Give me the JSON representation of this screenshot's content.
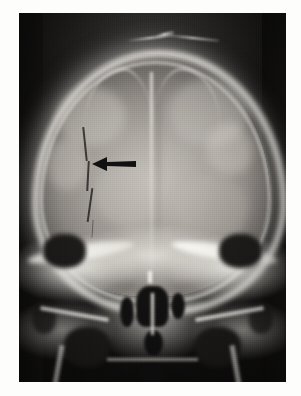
{
  "document": {
    "type": "radiograph",
    "modality": "plain-film-x-ray",
    "view": "frontal-ap-caldwell-skull",
    "background_color": "#fdfdfb",
    "film_color_dark": "#141312",
    "bone_color_light": "#f4f2ec",
    "annotation_color": "#111111"
  },
  "figure": {
    "caption": ""
  },
  "film": {
    "left": 19,
    "top": 13,
    "width": 267,
    "height": 369
  },
  "annotations": [
    {
      "name": "fracture-arrow",
      "shape": "solid-arrow",
      "direction": "left",
      "color": "#111111",
      "x": 92,
      "y": 156,
      "width": 44,
      "height": 16,
      "points_at": "linear-skull-fracture"
    }
  ],
  "anatomy": {
    "regions": [
      {
        "name": "cranial-vault",
        "label": "Cranial vault"
      },
      {
        "name": "calvarial-cortex",
        "label": "Calvarial cortical rim"
      },
      {
        "name": "sagittal-midline",
        "label": "Sagittal midline / falx"
      },
      {
        "name": "coronal-suture",
        "label": "Coronal suture"
      },
      {
        "name": "fracture-line",
        "label": "Linear fracture line"
      },
      {
        "name": "scalp-fold-marker",
        "label": "Scalp fold"
      },
      {
        "name": "orbital-roofs",
        "label": "Orbital roofs"
      },
      {
        "name": "petrous-ridges",
        "label": "Petrous ridges"
      },
      {
        "name": "nasal-cavity",
        "label": "Nasal cavity"
      },
      {
        "name": "ethmoid-sinuses",
        "label": "Ethmoid air cells"
      },
      {
        "name": "maxillary-sinuses",
        "label": "Maxillary sinuses"
      },
      {
        "name": "mastoid-air-cells",
        "label": "Mastoid air cells"
      },
      {
        "name": "mandible",
        "label": "Mandible"
      }
    ]
  },
  "blobs": [
    {
      "l": 14,
      "t": 20,
      "w": 26,
      "h": 16,
      "c": "rgba(212,209,202,0.40)"
    },
    {
      "l": 56,
      "t": 18,
      "w": 30,
      "h": 18,
      "c": "rgba(206,203,196,0.38)"
    },
    {
      "l": 28,
      "t": 40,
      "w": 26,
      "h": 18,
      "c": "rgba(196,193,187,0.30)"
    },
    {
      "l": 58,
      "t": 44,
      "w": 28,
      "h": 18,
      "c": "rgba(190,187,181,0.28)"
    },
    {
      "l": 36,
      "t": 58,
      "w": 34,
      "h": 16,
      "c": "rgba(182,179,173,0.26)"
    },
    {
      "l": 20,
      "t": 56,
      "w": 20,
      "h": 14,
      "c": "rgba(150,147,142,0.25)"
    },
    {
      "l": 70,
      "t": 30,
      "w": 18,
      "h": 14,
      "c": "rgba(222,219,212,0.34)"
    },
    {
      "l": 10,
      "t": 34,
      "w": 16,
      "h": 14,
      "c": "rgba(226,223,216,0.30)"
    }
  ]
}
